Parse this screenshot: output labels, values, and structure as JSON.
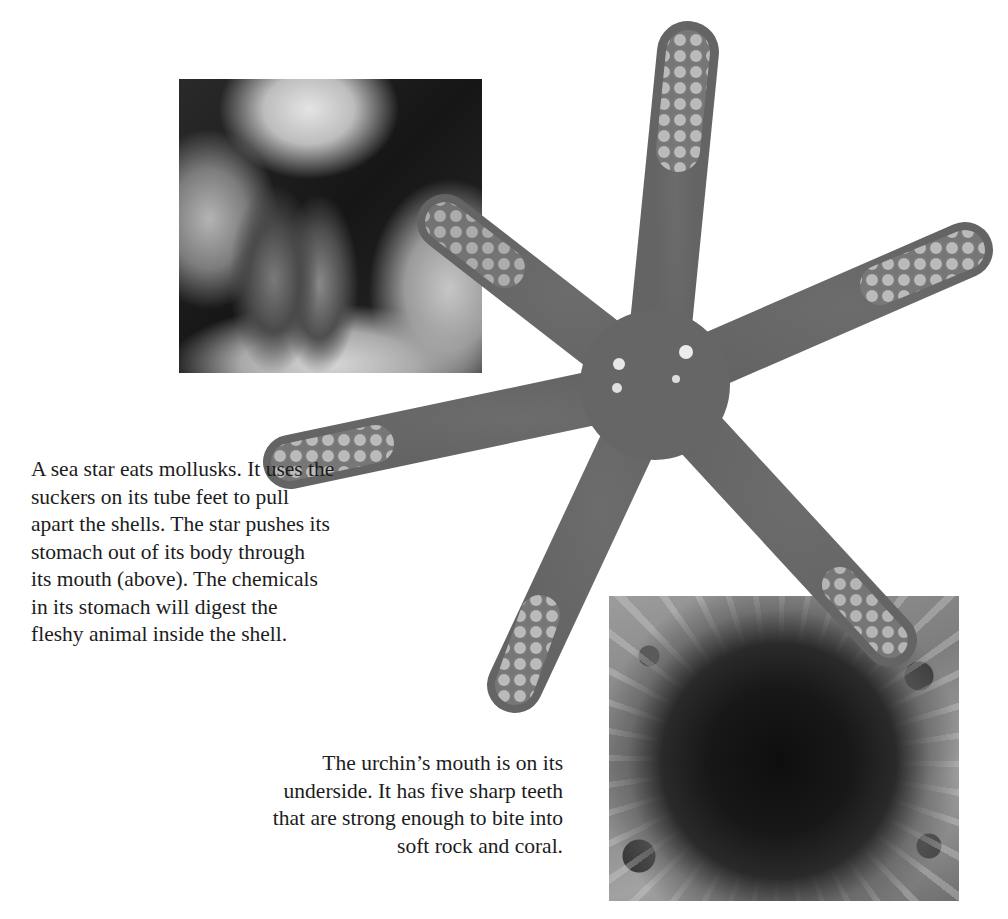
{
  "page": {
    "background": "#ffffff",
    "text_color": "#1c1c1c"
  },
  "photos": {
    "mollusk": {
      "subject": "sea star tube feet prying open a mollusk shell",
      "tone": "grayscale"
    },
    "seastar": {
      "subject": "six-armed sea star",
      "arms": 6,
      "body_color": "#6a6a6a",
      "tip_color": "#dcdcdc"
    },
    "urchin": {
      "subject": "sea urchin with long spines on rocky bottom",
      "tone": "grayscale"
    }
  },
  "captions": {
    "seastar": {
      "lines": [
        "A sea star eats mollusks. It uses the",
        "suckers on its tube feet to pull",
        "apart the shells. The star pushes its",
        "stomach out of its body through",
        "its mouth (above). The chemicals",
        "in its stomach will digest the",
        "fleshy animal inside the shell."
      ]
    },
    "urchin": {
      "lines": [
        "The urchin’s mouth is on its",
        "underside. It has five sharp teeth",
        "that are strong enough to bite into",
        "soft rock and coral."
      ]
    }
  }
}
